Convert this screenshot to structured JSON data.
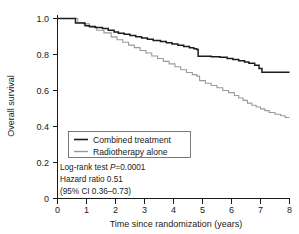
{
  "chart_data": {
    "type": "line",
    "title": "",
    "xlabel": "Time since randomization (years)",
    "ylabel": "Overall survival",
    "xlim": [
      0,
      8
    ],
    "ylim": [
      0,
      1.0
    ],
    "xticks": [
      "0",
      "1",
      "2",
      "3",
      "4",
      "5",
      "6",
      "7",
      "8"
    ],
    "yticks": [
      "0",
      "0.2",
      "0.4",
      "0.6",
      "0.8",
      "1.0"
    ],
    "grid": false,
    "legend_position": "center-left",
    "series": [
      {
        "name": "Combined treatment",
        "color": "#1b1b1b",
        "step": "post",
        "x": [
          0.0,
          0.6,
          0.62,
          0.8,
          0.95,
          1.1,
          1.3,
          1.55,
          1.75,
          1.95,
          2.1,
          2.3,
          2.5,
          2.7,
          2.9,
          3.1,
          3.3,
          3.55,
          3.75,
          3.95,
          4.15,
          4.35,
          4.55,
          4.7,
          4.8,
          4.85,
          5.3,
          5.6,
          5.85,
          6.05,
          6.25,
          6.45,
          6.6,
          6.8,
          6.95,
          7.05,
          8.0
        ],
        "y": [
          1.0,
          1.0,
          0.975,
          0.975,
          0.96,
          0.955,
          0.95,
          0.945,
          0.935,
          0.925,
          0.918,
          0.912,
          0.905,
          0.898,
          0.892,
          0.885,
          0.878,
          0.872,
          0.865,
          0.858,
          0.852,
          0.845,
          0.838,
          0.832,
          0.828,
          0.79,
          0.788,
          0.785,
          0.778,
          0.772,
          0.765,
          0.758,
          0.752,
          0.74,
          0.722,
          0.702,
          0.702
        ]
      },
      {
        "name": "Radiotherapy alone",
        "color": "#9a9a9a",
        "step": "post",
        "x": [
          0.0,
          0.62,
          0.7,
          0.9,
          1.1,
          1.35,
          1.6,
          1.85,
          2.05,
          2.25,
          2.45,
          2.65,
          2.85,
          3.05,
          3.25,
          3.45,
          3.65,
          3.85,
          4.05,
          4.25,
          4.45,
          4.65,
          4.8,
          4.9,
          5.1,
          5.3,
          5.5,
          5.7,
          5.9,
          6.1,
          6.25,
          6.4,
          6.55,
          6.7,
          6.85,
          7.0,
          7.15,
          7.3,
          7.5,
          7.7,
          7.85,
          8.0
        ],
        "y": [
          1.0,
          1.0,
          0.978,
          0.97,
          0.952,
          0.935,
          0.92,
          0.898,
          0.882,
          0.868,
          0.852,
          0.838,
          0.822,
          0.808,
          0.792,
          0.778,
          0.762,
          0.748,
          0.732,
          0.715,
          0.7,
          0.688,
          0.68,
          0.655,
          0.64,
          0.628,
          0.615,
          0.6,
          0.588,
          0.572,
          0.558,
          0.545,
          0.53,
          0.518,
          0.508,
          0.498,
          0.488,
          0.478,
          0.468,
          0.46,
          0.45,
          0.45
        ]
      }
    ],
    "annotations": [
      {
        "id": "logrank",
        "prefix": "Log-rank test ",
        "italic": "P",
        "suffix": "=0.0001"
      },
      {
        "id": "hazard_ratio",
        "text": "Hazard ratio 0.51"
      },
      {
        "id": "confidence_interval",
        "text": "(95% CI 0.36–0.73)"
      }
    ]
  }
}
